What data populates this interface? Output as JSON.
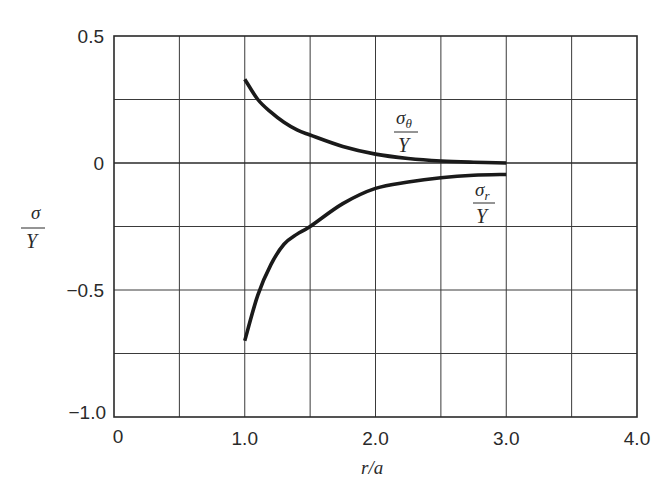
{
  "chart_data": {
    "type": "line",
    "title": "",
    "xlabel": "r/a",
    "ylabel": "σ/Y",
    "xlim": [
      0,
      4.0
    ],
    "ylim": [
      -1.0,
      0.5
    ],
    "grid": true,
    "legend_position": "inline",
    "x_ticks": [
      "0",
      "1.0",
      "2.0",
      "3.0",
      "4.0"
    ],
    "x_tick_values": [
      0,
      1.0,
      2.0,
      3.0,
      4.0
    ],
    "x_grid_step": 0.5,
    "y_ticks": [
      "0.5",
      "0",
      "−0.5",
      "−1.0"
    ],
    "y_tick_values": [
      0.5,
      0,
      -0.5,
      -1.0
    ],
    "y_grid_step": 0.25,
    "x": [
      1.0,
      1.1,
      1.2,
      1.3,
      1.4,
      1.5,
      1.75,
      2.0,
      2.25,
      2.5,
      2.75,
      3.0
    ],
    "series": [
      {
        "name": "σθ/Y",
        "label_numerator": "σ",
        "label_subscript": "θ",
        "label_denominator": "Y",
        "values": [
          0.33,
          0.25,
          0.2,
          0.16,
          0.13,
          0.11,
          0.065,
          0.035,
          0.018,
          0.008,
          0.003,
          0.0
        ]
      },
      {
        "name": "σr/Y",
        "label_numerator": "σ",
        "label_subscript": "r",
        "label_denominator": "Y",
        "values": [
          -0.7,
          -0.52,
          -0.4,
          -0.32,
          -0.28,
          -0.25,
          -0.16,
          -0.1,
          -0.075,
          -0.058,
          -0.048,
          -0.045
        ]
      }
    ]
  },
  "axis": {
    "y_label_numerator": "σ",
    "y_label_denominator": "Y",
    "x_label": "r/a"
  }
}
